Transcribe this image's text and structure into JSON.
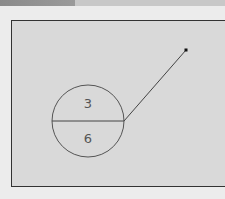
{
  "diagram": {
    "circle": {
      "top_label": "3",
      "bottom_label": "6",
      "center": [
        88,
        121
      ],
      "radius": 36,
      "stroke_color": "#555555"
    },
    "pointer": {
      "from": [
        124,
        121
      ],
      "to": [
        186,
        50
      ],
      "dot_color": "#111111"
    },
    "colors": {
      "background": "#ececec",
      "frame_fill": "#d9d9d9",
      "frame_border": "#333333",
      "topbar": "#c8c8c8",
      "topbar_dark": "#8a8a8a"
    }
  }
}
